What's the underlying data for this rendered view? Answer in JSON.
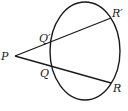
{
  "diagram": {
    "type": "geometry-secants",
    "stroke_color": "#1a1a1a",
    "background": "#ffffff",
    "ellipse": {
      "cx": 85,
      "cy": 51,
      "rx": 35,
      "ry": 49
    },
    "points": {
      "P": {
        "label": "P",
        "x": 15,
        "y": 56
      },
      "Q1": {
        "label": "Q′",
        "x": 51,
        "y": 41
      },
      "R1": {
        "label": "R′",
        "x": 111,
        "y": 18
      },
      "Q": {
        "label": "Q",
        "x": 51,
        "y": 67
      },
      "R": {
        "label": "R",
        "x": 111,
        "y": 83
      }
    },
    "lines": [
      {
        "from": "P",
        "to": "R1",
        "through": "Q1"
      },
      {
        "from": "P",
        "to": "R",
        "through": "Q"
      }
    ]
  }
}
